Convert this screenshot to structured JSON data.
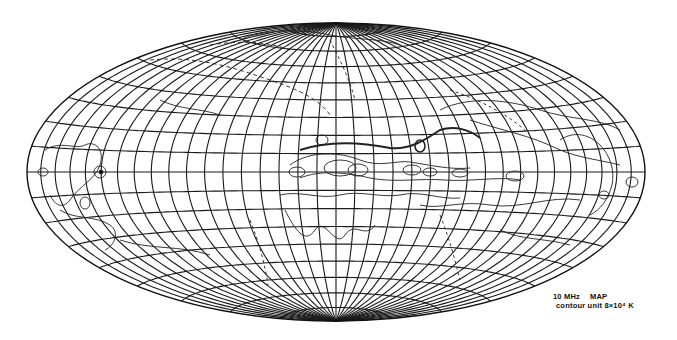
{
  "map": {
    "projection": "Hammer-Aitoff (all-sky)",
    "grid_spacing_deg": 10,
    "ellipse": {
      "cx": 336,
      "cy": 172,
      "rx": 309,
      "ry": 149
    },
    "colors": {
      "background": "#ffffff",
      "grid": "#1a1a1a",
      "contour": "#222222"
    }
  },
  "caption": {
    "title": "10 MHz",
    "title_suffix": "MAP",
    "subtitle": "contour unit  8×10⁴ K"
  }
}
